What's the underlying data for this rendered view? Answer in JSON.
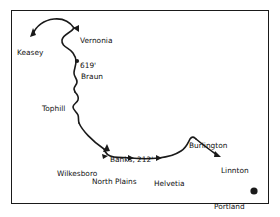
{
  "figure": {
    "type": "route-map",
    "title": "",
    "frame": {
      "border_color": "#1a1a1a",
      "background": "#ffffff"
    },
    "line_color": "#1a1a1a",
    "marker_color": "#1a1a1a"
  },
  "places": [
    {
      "name": "Keasey",
      "label": "Keasey",
      "label_x": 17,
      "label_y": 36,
      "marker": "arrow-up",
      "marker_x": 33,
      "marker_y": 31
    },
    {
      "name": "Vernonia",
      "label": "Vernonia",
      "elevation": "619'",
      "label_x": 80,
      "label_y": 24,
      "marker": "arrow-left",
      "marker_x": 77,
      "marker_y": 28
    },
    {
      "name": "Braun",
      "label": "Braun",
      "label_x": 80,
      "label_y": 58,
      "marker": "dot",
      "marker_x": 77,
      "marker_y": 61
    },
    {
      "name": "Tophill",
      "label": "Tophill",
      "label_x": 42,
      "label_y": 89,
      "marker": "none",
      "marker_x": 75,
      "marker_y": 92
    },
    {
      "name": "Banks",
      "label": "Banks, 212'",
      "label_x": 110,
      "label_y": 142,
      "marker": "arrow-up",
      "marker_x": 107,
      "marker_y": 150
    },
    {
      "name": "Wilkesboro",
      "label": "Wilkesboro",
      "label_x": 58,
      "label_y": 157,
      "marker": "none",
      "marker_x": 104,
      "marker_y": 157
    },
    {
      "name": "North Plains",
      "label": "North Plains",
      "label_x": 92,
      "label_y": 165,
      "marker": "arrow",
      "marker_x": 130,
      "marker_y": 159
    },
    {
      "name": "Helvetia",
      "label": "Helvetia",
      "label_x": 156,
      "label_y": 167,
      "marker": "arrow",
      "marker_x": 158,
      "marker_y": 159
    },
    {
      "name": "Burlington",
      "label": "Burlington",
      "label_x": 189,
      "label_y": 128,
      "marker": "peak",
      "marker_x": 196,
      "marker_y": 138
    },
    {
      "name": "Linnton",
      "label": "Linnton",
      "label_x": 222,
      "label_y": 153,
      "marker": "arrow-down-right",
      "marker_x": 218,
      "marker_y": 156
    },
    {
      "name": "Portland",
      "label": "Portland",
      "label_x": 215,
      "label_y": 188,
      "marker": "large-dot",
      "marker_x": 254,
      "marker_y": 191
    }
  ]
}
